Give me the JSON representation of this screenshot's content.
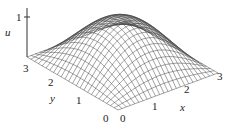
{
  "chart_data": {
    "type": "surface3d",
    "title": "",
    "function_hint": "u(x,y) = sin(pi x/3) sin(pi y/3)",
    "xlabel": "x",
    "ylabel": "y",
    "zlabel": "u",
    "x_ticks": [
      "0",
      "1",
      "2",
      "3"
    ],
    "y_ticks": [
      "0",
      "1",
      "2",
      "3"
    ],
    "z_ticks": [
      "1"
    ],
    "xlim": [
      0,
      3
    ],
    "ylim": [
      0,
      3
    ],
    "zlim": [
      0,
      1
    ],
    "grid_lines": 24,
    "mesh_color": "#444444"
  },
  "labels": {
    "u": "u",
    "x": "x",
    "y": "y",
    "z1": "1",
    "x0": "0",
    "x1": "1",
    "x2": "2",
    "x3": "3",
    "y0": "0",
    "y1": "1",
    "y2": "2",
    "y3": "3"
  }
}
